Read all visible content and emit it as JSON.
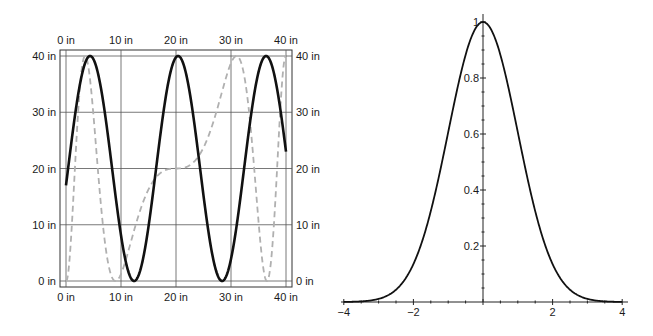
{
  "chart_data": [
    {
      "type": "line",
      "title": "",
      "xlabel": "",
      "ylabel": "",
      "units": "in",
      "xlim": [
        0,
        40
      ],
      "ylim": [
        0,
        40
      ],
      "grid": true,
      "frame": true,
      "x_ticks": [
        0,
        10,
        20,
        30,
        40
      ],
      "y_ticks": [
        0,
        10,
        20,
        30,
        40
      ],
      "x_tick_labels": [
        "0 in",
        "10 in",
        "20 in",
        "30 in",
        "40 in"
      ],
      "y_tick_labels": [
        "0 in",
        "10 in",
        "20 in",
        "30 in",
        "40 in"
      ],
      "tick_labels_on": [
        "top",
        "bottom",
        "left",
        "right"
      ],
      "series": [
        {
          "name": "solid",
          "style": "solid",
          "color": "#111111",
          "x": [
            0,
            2,
            4,
            6,
            8,
            10,
            12,
            14,
            16,
            18,
            20,
            22,
            24,
            26,
            28,
            30,
            32,
            34,
            36,
            38,
            40
          ],
          "values": [
            17,
            34,
            40,
            34,
            20,
            6,
            0,
            6,
            20,
            34,
            40,
            34,
            20,
            6,
            0,
            6,
            20,
            34,
            40,
            34,
            17
          ]
        },
        {
          "name": "dashed",
          "style": "dashed",
          "color": "#b0b0b0",
          "x": [
            0,
            1,
            3,
            5,
            7,
            8.5,
            10,
            12,
            14,
            16,
            18,
            20,
            22,
            24,
            26,
            28,
            30,
            31,
            33,
            35,
            37,
            39,
            40
          ],
          "values": [
            0,
            20,
            40,
            30,
            8,
            0,
            4,
            10,
            16,
            19,
            20,
            20,
            20,
            21,
            24,
            30,
            37,
            40,
            32,
            12,
            0,
            30,
            40
          ]
        }
      ]
    },
    {
      "type": "line",
      "title": "",
      "xlabel": "",
      "ylabel": "",
      "xlim": [
        -4,
        4
      ],
      "ylim": [
        0,
        1
      ],
      "grid": false,
      "frame": false,
      "axes_origin": [
        0,
        0
      ],
      "x_ticks": [
        -4,
        -2,
        2,
        4
      ],
      "y_ticks": [
        0.2,
        0.4,
        0.6,
        0.8,
        1
      ],
      "x_tick_labels": [
        "-4",
        "-2",
        "2",
        "4"
      ],
      "y_tick_labels": [
        "0.2",
        "0.4",
        "0.6",
        "0.8",
        "1"
      ],
      "series": [
        {
          "name": "exp(-x^2/2)",
          "style": "solid",
          "color": "#111111",
          "x": [
            -4,
            -3.5,
            -3,
            -2.5,
            -2,
            -1.5,
            -1,
            -0.5,
            0,
            0.5,
            1,
            1.5,
            2,
            2.5,
            3,
            3.5,
            4
          ],
          "values": [
            0.0003,
            0.0022,
            0.011,
            0.044,
            0.135,
            0.325,
            0.607,
            0.882,
            1,
            0.882,
            0.607,
            0.325,
            0.135,
            0.044,
            0.011,
            0.0022,
            0.0003
          ]
        }
      ]
    }
  ]
}
